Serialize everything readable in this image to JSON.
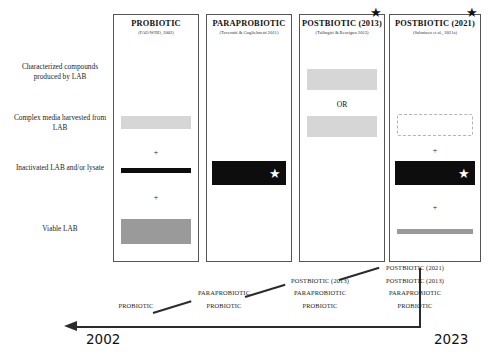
{
  "figure": {
    "row_labels": [
      "Characterized compounds produced by LAB",
      "Complex media harvested from LAB",
      "Inactivated LAB and/or lysate",
      "Viable LAB"
    ],
    "columns": [
      {
        "title": "PROBIOTIC",
        "subtitle": "(FAO/WHO, 2002)",
        "top_star": false,
        "elements": [
          {
            "kind": "bar",
            "style": "light-gray",
            "row": 2
          },
          {
            "kind": "plus",
            "label": "+"
          },
          {
            "kind": "bar",
            "style": "black-thin",
            "row": 3
          },
          {
            "kind": "plus",
            "label": "+"
          },
          {
            "kind": "bar",
            "style": "mid-gray",
            "row": 4
          }
        ]
      },
      {
        "title": "PARAPROBIOTIC",
        "subtitle": "(Taverniti & Guglielmetti 2011)",
        "top_star": false,
        "elements": [
          {
            "kind": "bar",
            "style": "black-thick-star",
            "row": 3
          }
        ]
      },
      {
        "title": "POSTBIOTIC (2013)",
        "subtitle": "(Tsilingiri & Rescigno 2013)",
        "top_star": true,
        "elements": [
          {
            "kind": "bar",
            "style": "light-gray",
            "row": 1
          },
          {
            "kind": "or",
            "label": "OR"
          },
          {
            "kind": "bar",
            "style": "light-gray",
            "row": 2
          }
        ]
      },
      {
        "title": "POSTBIOTIC (2021)",
        "subtitle": "(Salminen et al., 2021a)",
        "top_star": true,
        "elements": [
          {
            "kind": "bar",
            "style": "dashed-empty",
            "row": 2
          },
          {
            "kind": "plus",
            "label": "+"
          },
          {
            "kind": "bar",
            "style": "black-thick-star",
            "row": 3
          },
          {
            "kind": "plus",
            "label": "+"
          },
          {
            "kind": "bar",
            "style": "gray-thin",
            "row": 4
          }
        ]
      }
    ],
    "timeline": {
      "start_year": "2002",
      "end_year": "2023",
      "stacks": [
        {
          "terms": [
            "PROBIOTIC"
          ]
        },
        {
          "terms": [
            "PARAPROBIOTIC",
            "PROBIOTIC"
          ]
        },
        {
          "terms": [
            "POSTBIOTIC (2013)",
            "PARAPROBIOTIC",
            "PROBIOTIC"
          ]
        },
        {
          "terms": [
            "POSTBIOTIC (2021)",
            "POSTBIOTIC (2013)",
            "PARAPROBIOTIC",
            "PROBIOTIC"
          ]
        }
      ]
    },
    "star_glyph": "★",
    "colors": {
      "light_gray": "#d6d6d6",
      "mid_gray": "#9a9a9a",
      "black": "#0d0d0d",
      "axis": "#2b2b2b"
    }
  }
}
